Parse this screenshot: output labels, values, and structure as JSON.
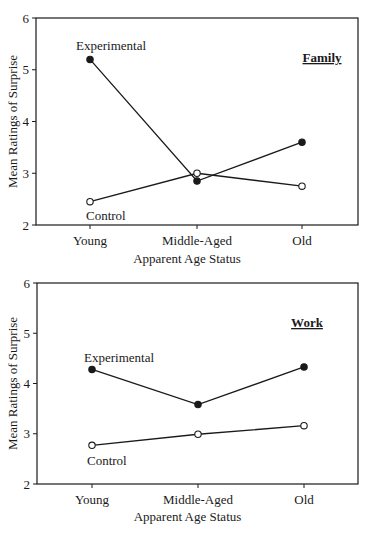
{
  "chart_data": [
    {
      "type": "line",
      "title": "Family",
      "categories": [
        "Young",
        "Middle-Aged",
        "Old"
      ],
      "series": [
        {
          "name": "Experimental",
          "marker": "filled-circle",
          "values": [
            5.2,
            2.85,
            3.6
          ]
        },
        {
          "name": "Control",
          "marker": "open-circle",
          "values": [
            2.45,
            3.0,
            2.75
          ]
        }
      ],
      "xlabel": "Apparent Age Status",
      "ylabel": "Mean Ratings of Surprise",
      "ylim": [
        2,
        6
      ],
      "yticks": [
        2,
        3,
        4,
        5,
        6
      ],
      "grid": false,
      "legend_position": "inline labels"
    },
    {
      "type": "line",
      "title": "Work",
      "categories": [
        "Young",
        "Middle-Aged",
        "Old"
      ],
      "series": [
        {
          "name": "Experimental",
          "marker": "filled-circle",
          "values": [
            4.28,
            3.58,
            4.33
          ]
        },
        {
          "name": "Control",
          "marker": "open-circle",
          "values": [
            2.77,
            2.99,
            3.16
          ]
        }
      ],
      "xlabel": "Apparent Age Status",
      "ylabel": "Mean Ratings of Surprise",
      "ylim": [
        2,
        6
      ],
      "yticks": [
        2,
        3,
        4,
        5,
        6
      ],
      "grid": false,
      "legend_position": "inline labels"
    }
  ],
  "panels": [
    {
      "title": "Family",
      "xlabel": "Apparent Age Status",
      "ylabel": "Mean Ratings of Surprise",
      "yticks": [
        "2",
        "3",
        "4",
        "5",
        "6"
      ],
      "xticks": [
        "Young",
        "Middle-Aged",
        "Old"
      ],
      "experimental_label": "Experimental",
      "control_label": "Control"
    },
    {
      "title": "Work",
      "xlabel": "Apparent Age Status",
      "ylabel": "Mean Ratings of Surprise",
      "yticks": [
        "2",
        "3",
        "4",
        "5",
        "6"
      ],
      "xticks": [
        "Young",
        "Middle-Aged",
        "Old"
      ],
      "experimental_label": "Experimental",
      "control_label": "Control"
    }
  ],
  "colors": {
    "line": "#1a1a1a",
    "background": "#ffffff"
  }
}
